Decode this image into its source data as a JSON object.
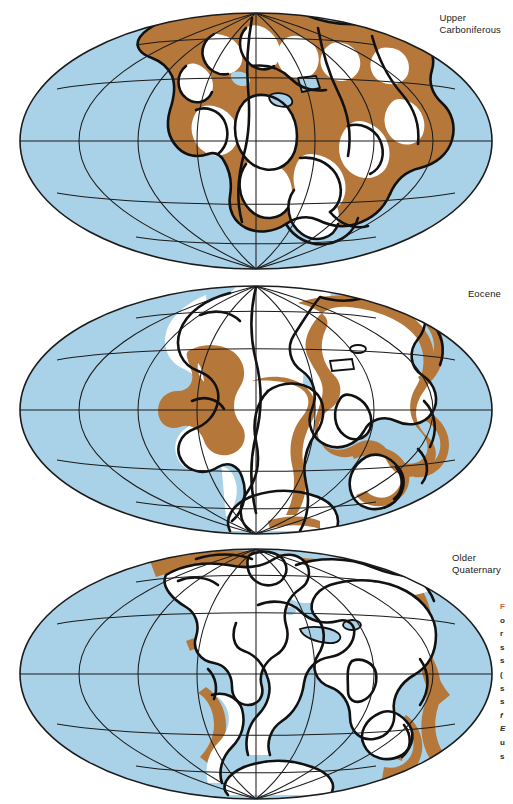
{
  "page": {
    "background_color": "#ffffff",
    "width": 513,
    "height": 804
  },
  "palette": {
    "ocean": "#a9d2e8",
    "shelf_land": "#b5773a",
    "emergent_land": "#ffffff",
    "coastline": "#111111",
    "graticule": "#1b1b1b",
    "label_text": "#1a1a1a",
    "caption_figno": "#d1603a",
    "caption_text": "#2b2b2b"
  },
  "maps": [
    {
      "id": "upper-carboniferous",
      "label": "Upper\nCarboniferous",
      "label_lines": [
        "Upper",
        "Carboniferous"
      ],
      "projection": "mollweide",
      "graticule": {
        "meridian_interval_deg": 30,
        "parallel_interval_deg": 30,
        "shows_equator": true,
        "shows_outline": true
      }
    },
    {
      "id": "eocene",
      "label": "Eocene",
      "label_lines": [
        "Eocene"
      ],
      "projection": "mollweide",
      "graticule": {
        "meridian_interval_deg": 30,
        "parallel_interval_deg": 30,
        "shows_equator": true,
        "shows_outline": true
      }
    },
    {
      "id": "older-quaternary",
      "label": "Older\nQuaternary",
      "label_lines": [
        "Older",
        "Quaternary"
      ],
      "projection": "mollweide",
      "graticule": {
        "meridian_interval_deg": 30,
        "parallel_interval_deg": 30,
        "shows_equator": true,
        "shows_outline": true
      }
    }
  ],
  "caption": {
    "clipped": true,
    "figure_number_initial": "F",
    "lines": [
      "F",
      "o",
      "r",
      "s",
      "s",
      "(",
      "s",
      "s",
      "f",
      "E",
      "u",
      "s"
    ]
  }
}
